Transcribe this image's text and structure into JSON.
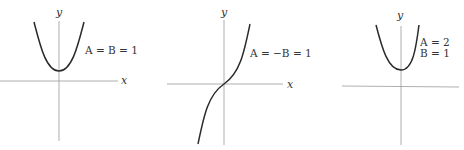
{
  "panels": [
    {
      "id": "panel-1",
      "x_label": "x",
      "y_label": "y",
      "annotation_lines": [
        "A = B = 1"
      ],
      "curve_type": "parabola-like (even), minimum above x-axis"
    },
    {
      "id": "panel-2",
      "x_label": "x",
      "y_label": "y",
      "annotation_lines": [
        "A = −B = 1"
      ],
      "curve_type": "odd S-curve through origin (sinh-like)"
    },
    {
      "id": "panel-3",
      "x_label": "",
      "y_label": "y",
      "annotation_lines": [
        "A = 2",
        "B = 1"
      ],
      "curve_type": "narrower parabola-like (even), minimum above x-axis"
    }
  ],
  "colors": {
    "axis": "#9a9a9a",
    "curve": "#2a2a2a",
    "text": "#333333",
    "background": "#ffffff"
  }
}
